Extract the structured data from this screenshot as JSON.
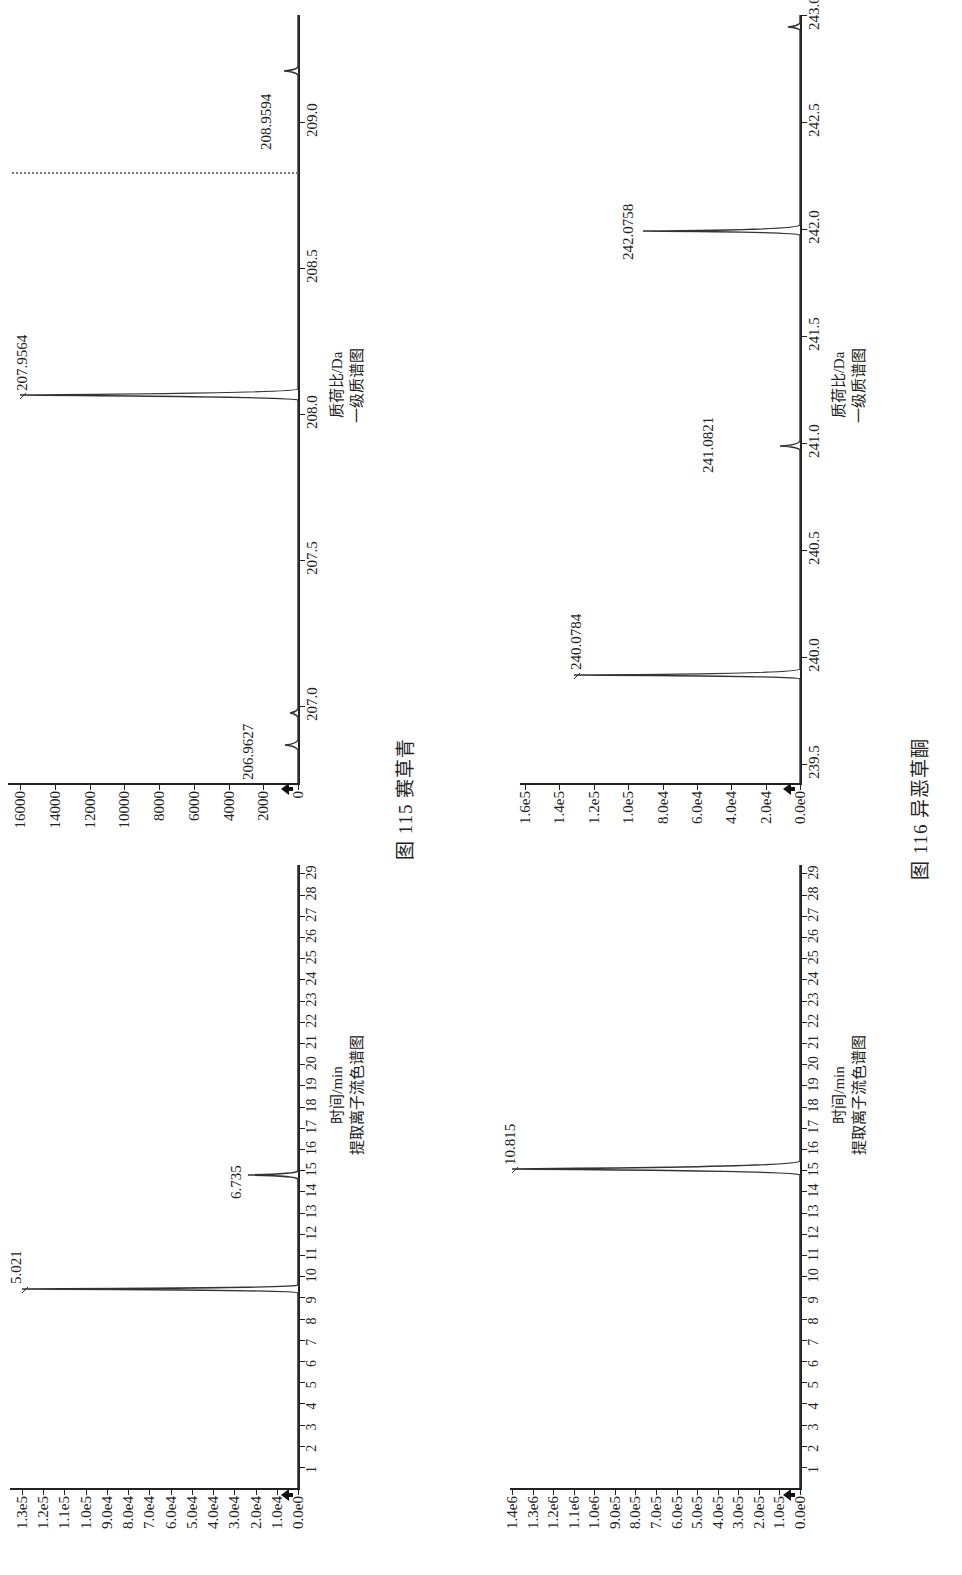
{
  "figures": [
    {
      "caption": "图 115   赛草青",
      "chromatogram": {
        "x_title": "时间/min",
        "subtitle": "提取离子流色谱图",
        "y_ticks": [
          "1.3e5",
          "1.2e5",
          "1.1e5",
          "1.0e5",
          "9.0e4",
          "8.0e4",
          "7.0e4",
          "6.0e4",
          "5.0e4",
          "4.0e4",
          "3.0e4",
          "2.0e4",
          "1.0e4",
          "0.0e0"
        ],
        "x_ticks": [
          "1",
          "2",
          "3",
          "4",
          "5",
          "6",
          "7",
          "8",
          "9",
          "10",
          "11",
          "12",
          "13",
          "14",
          "15",
          "16",
          "17",
          "18",
          "19",
          "20",
          "21",
          "22",
          "23",
          "24",
          "25",
          "26",
          "27",
          "28",
          "29"
        ],
        "peaks": [
          {
            "label": "5.021"
          },
          {
            "label": "6.735"
          }
        ]
      },
      "spectrum": {
        "x_title": "质荷比/Da",
        "subtitle": "一级质谱图",
        "y_ticks": [
          "16000",
          "14000",
          "12000",
          "10000",
          "8000",
          "6000",
          "4000",
          "2000",
          "0"
        ],
        "x_ticks": [
          "207.0",
          "207.5",
          "208.0",
          "208.5",
          "209.0"
        ],
        "peaks": [
          {
            "label": "206.9627"
          },
          {
            "label": "207.9564"
          },
          {
            "label": "208.9594"
          }
        ]
      }
    },
    {
      "caption": "图 116   异恶草酮",
      "chromatogram": {
        "x_title": "时间/min",
        "subtitle": "提取离子流色谱图",
        "y_ticks": [
          "1.4e6",
          "1.3e6",
          "1.2e6",
          "1.1e6",
          "1.0e6",
          "9.0e5",
          "8.0e5",
          "7.0e5",
          "6.0e5",
          "5.0e5",
          "4.0e5",
          "3.0e5",
          "2.0e5",
          "1.0e5",
          "0.0e0"
        ],
        "x_ticks": [
          "1",
          "2",
          "3",
          "4",
          "5",
          "6",
          "7",
          "8",
          "9",
          "10",
          "11",
          "12",
          "13",
          "14",
          "15",
          "16",
          "17",
          "18",
          "19",
          "20",
          "21",
          "22",
          "23",
          "24",
          "25",
          "26",
          "27",
          "28",
          "29"
        ],
        "peaks": [
          {
            "label": "10.815"
          }
        ]
      },
      "spectrum": {
        "x_title": "质荷比/Da",
        "subtitle": "一级质谱图",
        "y_ticks": [
          "1.6e5",
          "1.4e5",
          "1.2e5",
          "1.0e5",
          "8.0e4",
          "6.0e4",
          "4.0e4",
          "2.0e4",
          "0.0e0"
        ],
        "x_ticks": [
          "239.5",
          "240.0",
          "240.5",
          "241.0",
          "241.5",
          "242.0",
          "242.5",
          "243.0"
        ],
        "peaks": [
          {
            "label": "240.0784"
          },
          {
            "label": "241.0821"
          },
          {
            "label": "242.0758"
          }
        ]
      }
    }
  ],
  "chart_data": [
    {
      "type": "line",
      "title": "图 115 赛草青 — 提取离子流色谱图",
      "xlabel": "时间/min",
      "ylabel": "",
      "xlim": [
        0,
        29
      ],
      "ylim": [
        0,
        130000
      ],
      "peaks": [
        {
          "x": 5.021,
          "y": 130000,
          "label": "5.021"
        },
        {
          "x": 6.735,
          "y": 18000,
          "label": "6.735"
        }
      ]
    },
    {
      "type": "line",
      "title": "图 115 赛草青 — 一级质谱图",
      "xlabel": "质荷比/Da",
      "ylabel": "",
      "xlim": [
        206.8,
        209.2
      ],
      "ylim": [
        0,
        16000
      ],
      "peaks": [
        {
          "x": 206.9627,
          "y": 400,
          "label": "206.9627"
        },
        {
          "x": 207.9564,
          "y": 16000,
          "label": "207.9564"
        },
        {
          "x": 208.9594,
          "y": 500,
          "label": "208.9594"
        }
      ]
    },
    {
      "type": "line",
      "title": "图 116 异恶草酮 — 提取离子流色谱图",
      "xlabel": "时间/min",
      "ylabel": "",
      "xlim": [
        0,
        29
      ],
      "ylim": [
        0,
        1400000
      ],
      "peaks": [
        {
          "x": 10.815,
          "y": 1400000,
          "label": "10.815"
        }
      ]
    },
    {
      "type": "line",
      "title": "图 116 异恶草酮 — 一级质谱图",
      "xlabel": "质荷比/Da",
      "ylabel": "",
      "xlim": [
        239.3,
        243.2
      ],
      "ylim": [
        0,
        160000
      ],
      "peaks": [
        {
          "x": 240.0784,
          "y": 160000,
          "label": "240.0784"
        },
        {
          "x": 241.0821,
          "y": 14000,
          "label": "241.0821"
        },
        {
          "x": 242.0758,
          "y": 112000,
          "label": "242.0758"
        },
        {
          "x": 243.07,
          "y": 9000,
          "label": ""
        }
      ]
    }
  ]
}
